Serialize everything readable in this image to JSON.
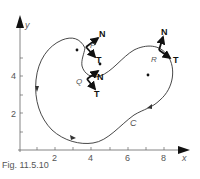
{
  "figure": {
    "caption": "Fig. 11.5.10",
    "curve_label": "C",
    "axes": {
      "x_label": "x",
      "y_label": "y",
      "x_ticks": [
        "2",
        "4",
        "6",
        "8"
      ],
      "y_ticks": [
        "4",
        "2"
      ]
    },
    "points": [
      {
        "name": "P",
        "normal_label": "N",
        "tangent_label": "T"
      },
      {
        "name": "Q",
        "normal_label": "N",
        "tangent_label": "T"
      },
      {
        "name": "R",
        "normal_label": "N",
        "tangent_label": "T"
      }
    ],
    "colors": {
      "ink": "#222222",
      "label": "#555555",
      "background": "#ffffff"
    }
  }
}
